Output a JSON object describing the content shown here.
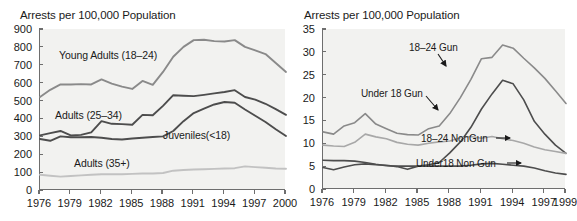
{
  "figure": {
    "panels": [
      {
        "id": "left",
        "title": "Arrests per 100,000 Population"
      },
      {
        "id": "right",
        "title": "Arrests per 100,000 Population"
      }
    ]
  },
  "chart_data": [
    {
      "type": "line",
      "id": "arrests-by-age-group",
      "title": "Arrests per 100,000 Population",
      "xlabel": "",
      "ylabel": "Arrests per 100,000 Population",
      "xlim": [
        1976,
        2000
      ],
      "ylim": [
        0,
        900
      ],
      "grid": false,
      "legend_position": "inline-annotations",
      "xticks": [
        "1976",
        "1979",
        "1982",
        "1985",
        "1988",
        "1991",
        "1994",
        "1997",
        "2000"
      ],
      "xtick_values": [
        1976,
        1979,
        1982,
        1985,
        1988,
        1991,
        1994,
        1997,
        2000
      ],
      "yticks": [
        "0",
        "100",
        "200",
        "300",
        "400",
        "500",
        "600",
        "700",
        "800",
        "900"
      ],
      "ytick_values": [
        0,
        100,
        200,
        300,
        400,
        500,
        600,
        700,
        800,
        900
      ],
      "x": [
        1976,
        1977,
        1978,
        1979,
        1980,
        1981,
        1982,
        1983,
        1984,
        1985,
        1986,
        1987,
        1988,
        1989,
        1990,
        1991,
        1992,
        1993,
        1994,
        1995,
        1996,
        1997,
        1998,
        1999,
        2000
      ],
      "series": [
        {
          "name": "Young Adults (18–24)",
          "color": "#8a8a8a",
          "values": [
            520,
            560,
            590,
            590,
            592,
            590,
            618,
            595,
            578,
            565,
            610,
            588,
            660,
            745,
            800,
            838,
            840,
            832,
            830,
            838,
            800,
            780,
            760,
            710,
            660
          ]
        },
        {
          "name": "Adults (25–34)",
          "color": "#4d4d4d",
          "values": [
            305,
            318,
            330,
            305,
            308,
            322,
            385,
            370,
            368,
            365,
            420,
            418,
            470,
            530,
            527,
            525,
            532,
            540,
            548,
            558,
            520,
            505,
            482,
            452,
            420
          ]
        },
        {
          "name": "Juveniles(<18)",
          "color": "#4d4d4d",
          "values": [
            285,
            275,
            300,
            295,
            295,
            296,
            292,
            285,
            282,
            288,
            292,
            296,
            300,
            330,
            385,
            430,
            455,
            478,
            492,
            488,
            450,
            415,
            380,
            340,
            302
          ]
        },
        {
          "name": "Adults (35+)",
          "color": "#c2c2c2",
          "values": [
            85,
            80,
            75,
            78,
            82,
            85,
            88,
            88,
            88,
            90,
            92,
            92,
            95,
            108,
            112,
            115,
            116,
            118,
            120,
            122,
            132,
            128,
            124,
            120,
            119
          ]
        }
      ]
    },
    {
      "type": "line",
      "id": "gun-nongun-by-age-group",
      "title": "Arrests per 100,000 Population",
      "xlabel": "",
      "ylabel": "Arrests per 100,000 Population",
      "xlim": [
        1976,
        1999
      ],
      "ylim": [
        0,
        35
      ],
      "grid": false,
      "legend_position": "inline-annotations",
      "xticks": [
        "1976",
        "1979",
        "1982",
        "1985",
        "1988",
        "1991",
        "1994",
        "1997",
        "1999"
      ],
      "xtick_values": [
        1976,
        1979,
        1982,
        1985,
        1988,
        1991,
        1994,
        1997,
        1999
      ],
      "yticks": [
        "0",
        "5",
        "10",
        "15",
        "20",
        "25",
        "30",
        "35"
      ],
      "ytick_values": [
        0,
        5,
        10,
        15,
        20,
        25,
        30,
        35
      ],
      "x": [
        1976,
        1977,
        1978,
        1979,
        1980,
        1981,
        1982,
        1983,
        1984,
        1985,
        1986,
        1987,
        1988,
        1989,
        1990,
        1991,
        1992,
        1993,
        1994,
        1995,
        1996,
        1997,
        1998,
        1999
      ],
      "series": [
        {
          "name": "18–24 Gun",
          "color": "#8a8a8a",
          "values": [
            12.5,
            12.0,
            13.8,
            14.5,
            16.5,
            14.2,
            13.2,
            12.2,
            11.9,
            11.8,
            13.2,
            13.8,
            16.5,
            20.0,
            24.0,
            28.5,
            28.8,
            31.5,
            30.8,
            28.6,
            26.5,
            24.2,
            21.5,
            18.7
          ]
        },
        {
          "name": "Under 18 Gun",
          "color": "#4d4d4d",
          "values": [
            4.7,
            4.2,
            4.8,
            5.3,
            5.5,
            5.3,
            5.2,
            4.9,
            4.3,
            5.0,
            5.3,
            5.8,
            7.9,
            10.3,
            13.5,
            17.5,
            20.8,
            23.8,
            23.0,
            19.5,
            14.8,
            12.0,
            9.6,
            7.8
          ]
        },
        {
          "name": "18–24 NonGun",
          "color": "#a8a8a8",
          "values": [
            9.6,
            9.4,
            9.3,
            10.2,
            12.0,
            11.4,
            11.0,
            10.2,
            9.8,
            9.6,
            10.0,
            10.3,
            10.5,
            11.2,
            11.5,
            11.1,
            11.5,
            11.0,
            10.6,
            10.0,
            9.2,
            8.6,
            8.2,
            7.8
          ]
        },
        {
          "name": "Under18 Non Gun",
          "color": "#4d4d4d",
          "values": [
            6.3,
            6.2,
            6.2,
            6.1,
            5.8,
            5.4,
            5.1,
            5.0,
            5.0,
            5.0,
            5.0,
            5.0,
            5.0,
            5.0,
            5.2,
            5.5,
            5.6,
            5.4,
            5.2,
            5.0,
            4.6,
            4.0,
            3.5,
            3.2
          ]
        }
      ],
      "annotations": [
        {
          "text": "18–24 Gun",
          "arrow": "down-right"
        },
        {
          "text": "Under 18 Gun",
          "arrow": "down-right"
        },
        {
          "text": "18–24 NonGun",
          "arrow": "right"
        },
        {
          "text": "Under18 Non Gun",
          "arrow": "right"
        }
      ]
    }
  ],
  "labels": {
    "left": {
      "young_adults": "Young Adults (18–24)",
      "adults_25_34": "Adults (25–34)",
      "juveniles": "Juveniles(<18)",
      "adults_35_plus": "Adults (35+)"
    },
    "right": {
      "gun_18_24": "18–24 Gun",
      "gun_under18": "Under 18 Gun",
      "nongun_18_24": "18–24 NonGun",
      "nongun_under18": "Under18 Non Gun"
    }
  }
}
